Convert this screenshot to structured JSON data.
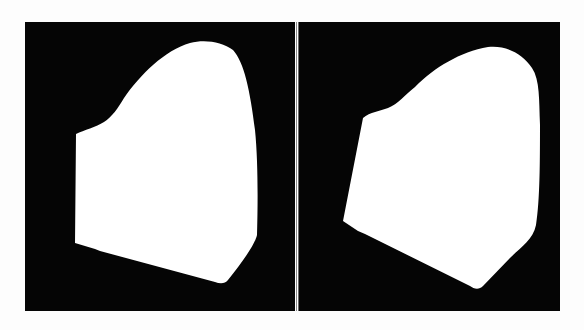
{
  "figure": {
    "panels": [
      {
        "id": "left",
        "label": "mask-view-1",
        "background": "#050505",
        "foreground": "#ffffff"
      },
      {
        "id": "right",
        "label": "mask-view-2",
        "background": "#050505",
        "foreground": "#ffffff"
      }
    ],
    "page_background": "#fdfdfd",
    "divider_color": "#ffffff"
  }
}
